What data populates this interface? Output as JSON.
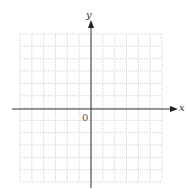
{
  "diagram": {
    "type": "coordinate-plane",
    "x_axis_label": "x",
    "y_axis_label": "y",
    "origin_label": "0",
    "grid": {
      "columns": 12,
      "rows": 12,
      "line_style": "dotted",
      "line_color": "#c8c8c8"
    },
    "axis_color": "#333333"
  }
}
